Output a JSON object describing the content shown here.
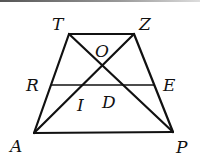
{
  "diagram": {
    "type": "geometry-trapezoid",
    "colors": {
      "stroke": "#111111",
      "background": "#ffffff"
    },
    "points": {
      "T": {
        "label": "T",
        "x": 69,
        "y": 34,
        "lx": 52,
        "ly": 30
      },
      "Z": {
        "label": "Z",
        "x": 134,
        "y": 34,
        "lx": 139,
        "ly": 30
      },
      "A": {
        "label": "A",
        "x": 34,
        "y": 133,
        "lx": 10,
        "ly": 152
      },
      "P": {
        "label": "P",
        "x": 173,
        "y": 132,
        "lx": 176,
        "ly": 153
      },
      "R": {
        "label": "R",
        "x": 51,
        "y": 85,
        "lx": 26,
        "ly": 91
      },
      "E": {
        "label": "E",
        "x": 154,
        "y": 85,
        "lx": 163,
        "ly": 91
      },
      "O": {
        "label": "O",
        "lx": 95,
        "ly": 57
      },
      "I": {
        "label": "I",
        "lx": 77,
        "ly": 111
      },
      "D": {
        "label": "D",
        "lx": 102,
        "ly": 108
      }
    },
    "segments": [
      [
        "T",
        "Z"
      ],
      [
        "A",
        "P"
      ],
      [
        "T",
        "A"
      ],
      [
        "Z",
        "P"
      ],
      [
        "T",
        "P"
      ],
      [
        "Z",
        "A"
      ],
      [
        "R",
        "E"
      ]
    ]
  }
}
